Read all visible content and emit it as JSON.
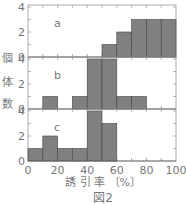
{
  "figure": {
    "caption": "図2",
    "ylabel_chars": [
      "個",
      "体",
      "数"
    ],
    "xlabel": "誘 引 率 〔%〕"
  },
  "chart_data": {
    "type": "bar",
    "title": "図2",
    "xlabel": "誘引率〔%〕",
    "ylabel": "個体数",
    "bins": [
      0,
      10,
      20,
      30,
      40,
      50,
      60,
      70,
      80,
      90,
      100
    ],
    "x_ticks": [
      0,
      20,
      40,
      60,
      80,
      100
    ],
    "y_ticks": [
      0,
      2,
      4
    ],
    "xlim": [
      0,
      100
    ],
    "ylim": [
      0,
      5
    ],
    "bar_color": "#808080",
    "panels": [
      {
        "name": "a",
        "values": [
          0,
          0,
          0,
          0,
          0,
          1,
          2,
          3,
          3,
          3
        ]
      },
      {
        "name": "b",
        "values": [
          0,
          1,
          0,
          1,
          4,
          4,
          1,
          1,
          0,
          0
        ]
      },
      {
        "name": "c",
        "values": [
          1,
          2,
          1,
          1,
          4,
          3,
          0,
          0,
          0,
          0
        ]
      }
    ]
  }
}
